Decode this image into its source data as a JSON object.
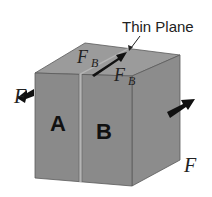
{
  "diagram": {
    "annotation": "Thin Plane",
    "block_left_label": "A",
    "block_right_label": "B",
    "force_left_label": "F",
    "force_right_label": "F",
    "force_plane_label_1": "F",
    "force_plane_sub_1": "B",
    "force_plane_label_2": "F",
    "force_plane_sub_2": "B",
    "colors": {
      "front_face": "#8a8a8a",
      "top_face": "#9a9a9a",
      "right_face": "#888888",
      "edge": "#555555",
      "arrow": "#111111",
      "text": "#222222"
    }
  }
}
